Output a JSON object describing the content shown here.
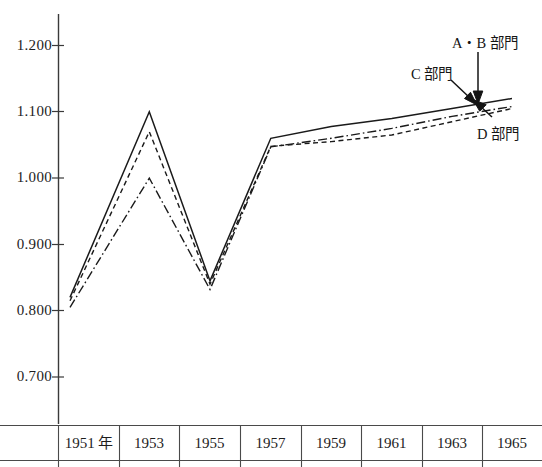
{
  "chart_data": {
    "type": "line",
    "title": "",
    "xlabel": "",
    "ylabel": "",
    "categories": [
      "1951 年",
      "1953",
      "1955",
      "1957",
      "1959",
      "1961",
      "1963",
      "1965"
    ],
    "x": [
      1951,
      1953,
      1955,
      1957,
      1959,
      1961,
      1963,
      1965
    ],
    "ylim": [
      0.65,
      1.25
    ],
    "yticks": [
      "0.700",
      "0.800",
      "0.900",
      "1.000",
      "1.100",
      "1.200"
    ],
    "ytick_values": [
      0.7,
      0.8,
      0.9,
      1.0,
      1.1,
      1.2
    ],
    "grid": false,
    "legend_position": "annotations-right",
    "series": [
      {
        "name": "A・B 部門",
        "style": "solid",
        "color": "#1a1a1a",
        "values": [
          0.82,
          1.1,
          0.845,
          1.06,
          1.078,
          1.09,
          1.105,
          1.12
        ]
      },
      {
        "name": "C 部門",
        "style": "dashed",
        "color": "#1a1a1a",
        "values": [
          0.815,
          1.07,
          0.84,
          1.048,
          1.055,
          1.065,
          1.085,
          1.105
        ]
      },
      {
        "name": "D 部門",
        "style": "dash-dot",
        "color": "#1a1a1a",
        "values": [
          0.805,
          1.0,
          0.832,
          1.047,
          1.06,
          1.075,
          1.093,
          1.108
        ]
      }
    ],
    "annotations": [
      {
        "text": "A・B 部門",
        "target_series": "A・B 部門"
      },
      {
        "text": "C 部門",
        "target_series": "C 部門"
      },
      {
        "text": "D 部門",
        "target_series": "D 部門"
      }
    ]
  },
  "axis": {
    "y_labels": [
      "1.200",
      "1.100",
      "1.000",
      "0.900",
      "0.800",
      "0.700"
    ],
    "x_labels": [
      "1951 年",
      "1953",
      "1955",
      "1957",
      "1959",
      "1961",
      "1963",
      "1965"
    ]
  },
  "labels": {
    "ab": "A・B 部門",
    "c": "C 部門",
    "d": "D 部門"
  }
}
